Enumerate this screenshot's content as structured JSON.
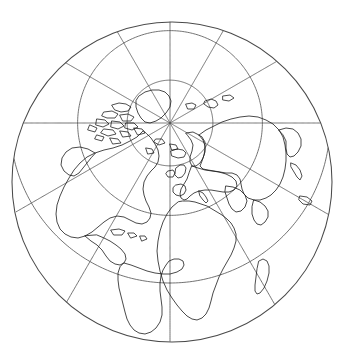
{
  "figure": {
    "projection_name": "Stereographic polar projection",
    "hemisphere": "Northern Hemisphere centred view",
    "background_color": "#ffffff",
    "line_color": "#1c1c1c",
    "graticule_color": "#5a5a5a",
    "limb_color": "#4a4a4a",
    "width_px": 346,
    "height_px": 357
  },
  "projection": {
    "type": "stereographic",
    "center_latitude_deg": 90,
    "center_longitude_deg": 0,
    "pole_x_px": 170,
    "pole_y_px": 123,
    "disc_center_x_px": 172,
    "disc_center_y_px": 182,
    "disc_radius_px": 160,
    "scale_px_per_unit": 160,
    "limb_latitude_deg": -35,
    "orientation": "0 degrees meridian toward bottom of image"
  },
  "graticule": {
    "meridian_interval_deg": 30,
    "parallel_interval_deg": 30,
    "meridian_longitudes_deg": [
      0,
      30,
      60,
      90,
      120,
      150,
      180,
      210,
      240,
      270,
      300,
      330
    ],
    "parallel_latitudes_deg": [
      60,
      30,
      0,
      -30
    ],
    "grid_visible": true,
    "labels_visible": false,
    "parallel_labels": [
      "60N",
      "30N",
      "0",
      "30S"
    ],
    "meridian_labels": [
      "0",
      "30E",
      "60E",
      "90E",
      "120E",
      "150E",
      "180",
      "150W",
      "120W",
      "90W",
      "60W",
      "30W"
    ]
  },
  "features": {
    "outer_limb": "map boundary circle",
    "landmasses": [
      "North America",
      "Greenland",
      "Canadian Arctic Archipelago",
      "Alaska",
      "Iceland",
      "Europe",
      "Scandinavia",
      "British Isles",
      "Africa",
      "Madagascar",
      "Asia",
      "Siberia",
      "Arabian Peninsula",
      "India",
      "South America",
      "Central America",
      "Caribbean islands"
    ],
    "coastline_style": "thin black outline, no fill"
  }
}
